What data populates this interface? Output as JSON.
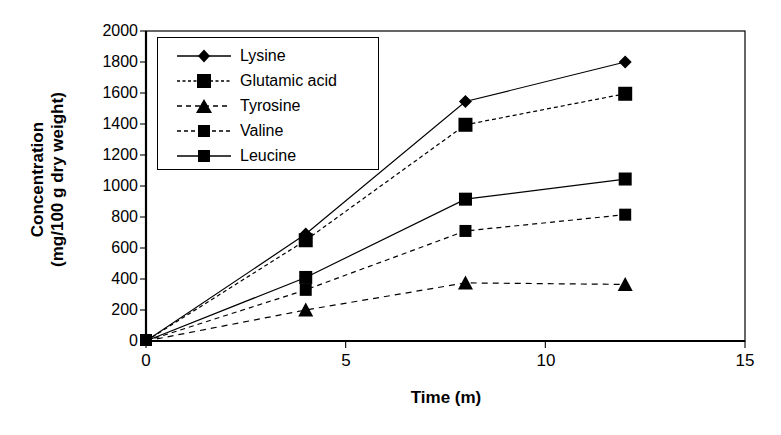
{
  "chart_data": {
    "type": "line",
    "title": "",
    "xlabel": "Time (m)",
    "ylabel_line1": "Concentration",
    "ylabel_line2": "(mg/100 g dry weight)",
    "x": [
      0,
      4,
      8,
      12
    ],
    "xlim": [
      0,
      15
    ],
    "ylim": [
      0,
      2000
    ],
    "xticks": [
      0,
      5,
      10,
      15
    ],
    "xtick_labels": [
      "0",
      "5",
      "10",
      "15"
    ],
    "yticks": [
      0,
      200,
      400,
      600,
      800,
      1000,
      1200,
      1400,
      1600,
      1800,
      2000
    ],
    "ytick_labels": [
      "0",
      "200",
      "400",
      "600",
      "800",
      "1000",
      "1200",
      "1400",
      "1600",
      "1800",
      "2000"
    ],
    "grid": false,
    "legend_position": "upper-left-inside",
    "series": [
      {
        "name": "Lysine",
        "marker": "diamond",
        "line_style": "solid",
        "color": "#000000",
        "values": [
          0,
          690,
          1545,
          1800
        ]
      },
      {
        "name": "Glutamic acid",
        "marker": "square",
        "line_style": "dashed",
        "color": "#000000",
        "values": [
          0,
          650,
          1395,
          1595
        ]
      },
      {
        "name": "Tyrosine",
        "marker": "triangle",
        "line_style": "dashed",
        "color": "#000000",
        "values": [
          0,
          200,
          375,
          365
        ]
      },
      {
        "name": "Valine",
        "marker": "square",
        "line_style": "dashed",
        "color": "#000000",
        "values": [
          0,
          330,
          710,
          815
        ]
      },
      {
        "name": "Leucine",
        "marker": "square",
        "line_style": "solid",
        "color": "#000000",
        "values": [
          0,
          410,
          915,
          1045
        ]
      }
    ]
  }
}
